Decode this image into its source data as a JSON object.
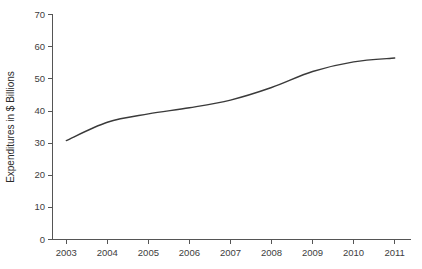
{
  "chart_data": {
    "type": "line",
    "title": "",
    "subtitle": "",
    "xlabel": "",
    "ylabel": "Expenditures in $ Billions",
    "categories": [
      "2003",
      "2004",
      "2005",
      "2006",
      "2007",
      "2008",
      "2009",
      "2010",
      "2011"
    ],
    "x": [
      2003,
      2004,
      2005,
      2006,
      2007,
      2008,
      2009,
      2010,
      2011
    ],
    "values": [
      30.8,
      36.5,
      39.1,
      41.0,
      43.4,
      47.3,
      52.3,
      55.3,
      56.5
    ],
    "series": [
      {
        "name": "Expenditures",
        "values": [
          30.8,
          36.5,
          39.1,
          41.0,
          43.4,
          47.3,
          52.3,
          55.3,
          56.5
        ]
      }
    ],
    "ylim": [
      0,
      70
    ],
    "ytick_step": 10,
    "yticks": [
      0,
      10,
      20,
      30,
      40,
      50,
      60,
      70
    ],
    "ytick_labels": [
      "0",
      "10",
      "20",
      "30",
      "40",
      "50",
      "60",
      "70"
    ],
    "xtick_labels": [
      "2003",
      "2004",
      "2005",
      "2006",
      "2007",
      "2008",
      "2009",
      "2010",
      "2011"
    ],
    "grid": false,
    "legend": false,
    "legend_position": "none",
    "line_color": "#3a3a3a",
    "axis_color": "#555555",
    "background_color": "#ffffff",
    "annotations": []
  },
  "axes": {
    "y_title": "Expenditures in $ Billions",
    "x_title": ""
  }
}
